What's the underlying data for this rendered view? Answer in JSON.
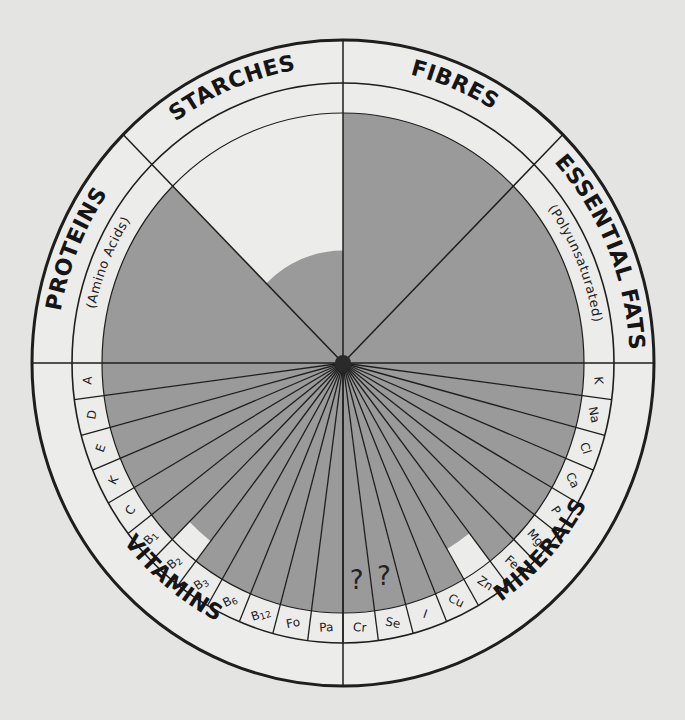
{
  "diagram": {
    "colors": {
      "background": "#e4e4e2",
      "band": "#ececea",
      "fill": "#9a9a9a",
      "line": "#1e1e1e"
    },
    "categories": [
      {
        "name": "PROTEINS",
        "sub": "(Amino Acids)",
        "fill_fraction": 1.0
      },
      {
        "name": "STARCHES",
        "sub": "",
        "fill_fraction": 0.45
      },
      {
        "name": "FIBRES",
        "sub": "",
        "fill_fraction": 1.0
      },
      {
        "name": "ESSENTIAL FATS",
        "sub": "(Polyunsaturated)",
        "fill_fraction": 1.0
      }
    ],
    "groups": [
      {
        "name": "VITAMINS"
      },
      {
        "name": "MINERALS"
      }
    ],
    "nutrients": [
      {
        "label": "A",
        "group": "VITAMINS",
        "fill_fraction": 1.0
      },
      {
        "label": "D",
        "group": "VITAMINS",
        "fill_fraction": 1.0
      },
      {
        "label": "E",
        "group": "VITAMINS",
        "fill_fraction": 1.0
      },
      {
        "label": "K",
        "group": "VITAMINS",
        "fill_fraction": 1.0
      },
      {
        "label": "C",
        "group": "VITAMINS",
        "fill_fraction": 1.0
      },
      {
        "label": "B1",
        "group": "VITAMINS",
        "fill_fraction": 1.0
      },
      {
        "label": "B2",
        "group": "VITAMINS",
        "fill_fraction": 0.9
      },
      {
        "label": "B3",
        "group": "VITAMINS",
        "fill_fraction": 1.0
      },
      {
        "label": "B6",
        "group": "VITAMINS",
        "fill_fraction": 1.0
      },
      {
        "label": "B12",
        "group": "VITAMINS",
        "fill_fraction": 1.0
      },
      {
        "label": "Fo",
        "group": "VITAMINS",
        "fill_fraction": 1.0
      },
      {
        "label": "Pa",
        "group": "VITAMINS",
        "fill_fraction": 1.0
      },
      {
        "label": "Cr",
        "group": "MINERALS",
        "fill_fraction": 1.0,
        "annotation": "?"
      },
      {
        "label": "Se",
        "group": "MINERALS",
        "fill_fraction": 1.0,
        "annotation": "?"
      },
      {
        "label": "I",
        "group": "MINERALS",
        "fill_fraction": 1.0
      },
      {
        "label": "Cu",
        "group": "MINERALS",
        "fill_fraction": 1.0
      },
      {
        "label": "Zn",
        "group": "MINERALS",
        "fill_fraction": 0.86
      },
      {
        "label": "Fe",
        "group": "MINERALS",
        "fill_fraction": 1.0
      },
      {
        "label": "Mg",
        "group": "MINERALS",
        "fill_fraction": 1.0
      },
      {
        "label": "P",
        "group": "MINERALS",
        "fill_fraction": 1.0
      },
      {
        "label": "Ca",
        "group": "MINERALS",
        "fill_fraction": 1.0
      },
      {
        "label": "Cl",
        "group": "MINERALS",
        "fill_fraction": 1.0
      },
      {
        "label": "Na",
        "group": "MINERALS",
        "fill_fraction": 1.0
      },
      {
        "label": "K",
        "group": "MINERALS",
        "fill_fraction": 1.0
      }
    ]
  }
}
